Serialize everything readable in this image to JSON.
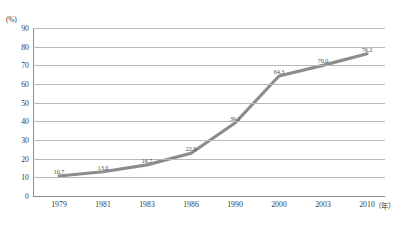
{
  "chart_data": {
    "type": "line",
    "title": "",
    "subtitle": "",
    "xlabel": "年",
    "ylabel": "(%)",
    "ylim": [
      0,
      90
    ],
    "ytick_labels": [
      "0",
      "10",
      "20",
      "30",
      "40",
      "50",
      "60",
      "70",
      "80",
      "90"
    ],
    "ytick_values": [
      0,
      10,
      20,
      30,
      40,
      50,
      60,
      70,
      80,
      90
    ],
    "grid": true,
    "legend": "none",
    "categories": [
      "1979",
      "1981",
      "1983",
      "1986",
      "1990",
      "2000",
      "2003",
      "2010"
    ],
    "values": [
      10.7,
      13.0,
      16.7,
      22.9,
      39.1,
      64.3,
      70.0,
      76.2
    ],
    "point_labels": [
      "10.7",
      "13.0",
      "16.7",
      "22.9",
      "39.1",
      "64.3",
      "70.0",
      "76.2"
    ],
    "series": [
      {
        "name": "",
        "color": "#8c8c8c",
        "values": [
          10.7,
          13.0,
          16.7,
          22.9,
          39.1,
          64.3,
          70.0,
          76.2
        ]
      }
    ],
    "line_color": "#8c8c8c",
    "grid_color": "#b8b8b8",
    "axis_color": "#8e8e8e",
    "line_width": 3.2
  }
}
